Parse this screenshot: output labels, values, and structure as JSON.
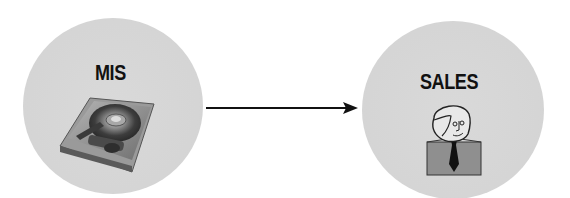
{
  "diagram": {
    "type": "flow",
    "nodes": [
      {
        "id": "mis",
        "label": "MIS",
        "icon": "hard-drive-icon",
        "fill": "#d6d6d6"
      },
      {
        "id": "sales",
        "label": "SALES",
        "icon": "person-icon",
        "fill": "#d6d6d6"
      }
    ],
    "edges": [
      {
        "from": "mis",
        "to": "sales",
        "style": "solid-arrow",
        "color": "#111111"
      }
    ]
  },
  "colors": {
    "node_fill": "#d6d6d6",
    "text": "#111111",
    "arrow": "#111111",
    "background": "#ffffff"
  }
}
